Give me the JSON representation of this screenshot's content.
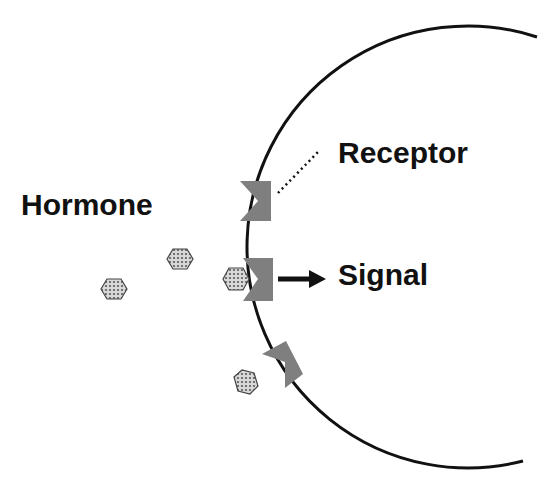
{
  "labels": {
    "hormone": "Hormone",
    "receptor": "Receptor",
    "signal": "Signal"
  },
  "colors": {
    "background": "#ffffff",
    "membrane": "#111111",
    "receptor_fill": "#7f7f7f",
    "hormone_fill": "#bfbfbf",
    "hormone_stroke": "#444444",
    "text": "#111111"
  },
  "diagram": {
    "cell": {
      "shape": "arc",
      "center": [
        478,
        247
      ],
      "radius": 221
    },
    "receptors": [
      {
        "id": "receptor-1",
        "bound": false
      },
      {
        "id": "receptor-2",
        "bound": true
      },
      {
        "id": "receptor-3",
        "bound": false
      }
    ],
    "hormones": [
      {
        "id": "hormone-1",
        "center": [
          114,
          289
        ]
      },
      {
        "id": "hormone-2",
        "center": [
          180,
          259
        ]
      },
      {
        "id": "hormone-3",
        "center": [
          236,
          279
        ]
      },
      {
        "id": "hormone-4",
        "center": [
          246,
          382
        ]
      }
    ]
  }
}
